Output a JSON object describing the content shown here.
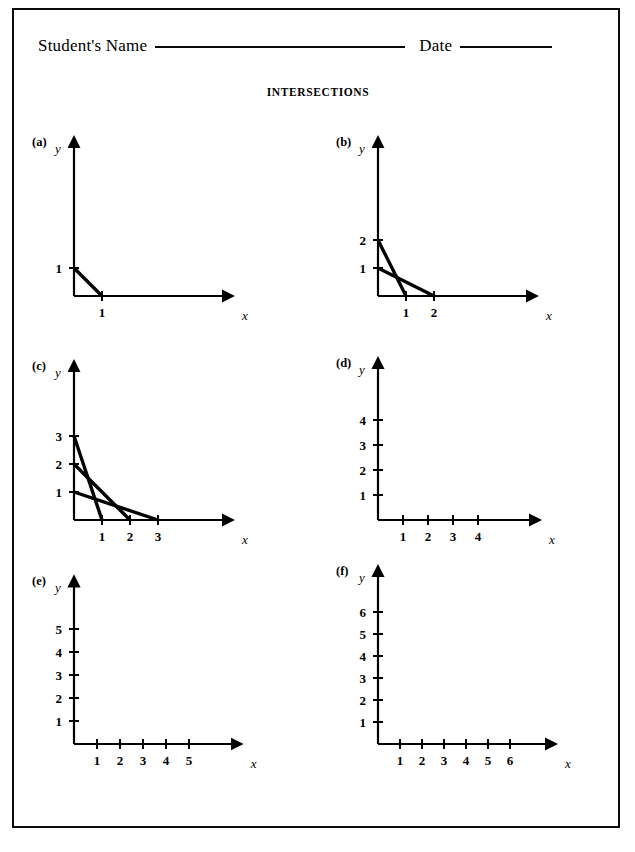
{
  "page": {
    "background": "#ffffff",
    "ink": "#000000",
    "border_color": "#0a0a0a"
  },
  "header": {
    "name_label": "Student's Name",
    "date_label": "Date",
    "name_rule": "____________________",
    "date_rule": "________"
  },
  "title": "INTERSECTIONS",
  "axis_labels": {
    "x": "x",
    "y": "y"
  },
  "panels": [
    {
      "tag": "(a)",
      "x_ticks": [
        1
      ],
      "y_ticks": [
        1
      ],
      "x_max": 5.6,
      "y_max": 5.6,
      "unit": 28,
      "segments": [
        {
          "x_intercept": 1,
          "y_intercept": 1
        }
      ]
    },
    {
      "tag": "(b)",
      "x_ticks": [
        1,
        2
      ],
      "y_ticks": [
        1,
        2
      ],
      "x_max": 5.6,
      "y_max": 5.6,
      "unit": 28,
      "segments": [
        {
          "x_intercept": 1,
          "y_intercept": 2
        },
        {
          "x_intercept": 2,
          "y_intercept": 1
        }
      ]
    },
    {
      "tag": "(c)",
      "x_ticks": [
        1,
        2,
        3
      ],
      "y_ticks": [
        1,
        2,
        3
      ],
      "x_max": 5.6,
      "y_max": 5.6,
      "unit": 28,
      "segments": [
        {
          "x_intercept": 1,
          "y_intercept": 3
        },
        {
          "x_intercept": 2,
          "y_intercept": 2
        },
        {
          "x_intercept": 3,
          "y_intercept": 1
        }
      ]
    },
    {
      "tag": "(d)",
      "x_ticks": [
        1,
        2,
        3,
        4
      ],
      "y_ticks": [
        1,
        2,
        3,
        4
      ],
      "x_max": 6.4,
      "y_max": 6.4,
      "unit": 25,
      "segments": []
    },
    {
      "tag": "(e)",
      "x_ticks": [
        1,
        2,
        3,
        4,
        5
      ],
      "y_ticks": [
        1,
        2,
        3,
        4,
        5
      ],
      "x_max": 7.2,
      "y_max": 7.2,
      "unit": 23,
      "segments": []
    },
    {
      "tag": "(f)",
      "x_ticks": [
        1,
        2,
        3,
        4,
        5,
        6
      ],
      "y_ticks": [
        1,
        2,
        3,
        4,
        5,
        6
      ],
      "x_max": 8.0,
      "y_max": 8.0,
      "unit": 22,
      "segments": []
    }
  ],
  "chart_data": {
    "type": "line",
    "title": "INTERSECTIONS",
    "xlabel": "x",
    "ylabel": "y",
    "charts": [
      {
        "label": "(a)",
        "xlim": [
          0,
          5.6
        ],
        "ylim": [
          0,
          5.6
        ],
        "xticks": [
          1
        ],
        "yticks": [
          1
        ],
        "grid": false,
        "series": [
          {
            "name": "segment-1",
            "x": [
              0,
              1
            ],
            "y": [
              1,
              0
            ]
          }
        ]
      },
      {
        "label": "(b)",
        "xlim": [
          0,
          5.6
        ],
        "ylim": [
          0,
          5.6
        ],
        "xticks": [
          1,
          2
        ],
        "yticks": [
          1,
          2
        ],
        "grid": false,
        "series": [
          {
            "name": "segment-1",
            "x": [
              0,
              1
            ],
            "y": [
              2,
              0
            ]
          },
          {
            "name": "segment-2",
            "x": [
              0,
              2
            ],
            "y": [
              1,
              0
            ]
          }
        ],
        "intersections": [
          {
            "x": 0.667,
            "y": 0.667
          }
        ]
      },
      {
        "label": "(c)",
        "xlim": [
          0,
          5.6
        ],
        "ylim": [
          0,
          5.6
        ],
        "xticks": [
          1,
          2,
          3
        ],
        "yticks": [
          1,
          2,
          3
        ],
        "grid": false,
        "series": [
          {
            "name": "segment-1",
            "x": [
              0,
              1
            ],
            "y": [
              3,
              0
            ]
          },
          {
            "name": "segment-2",
            "x": [
              0,
              2
            ],
            "y": [
              2,
              0
            ]
          },
          {
            "name": "segment-3",
            "x": [
              0,
              3
            ],
            "y": [
              1,
              0
            ]
          }
        ],
        "intersections": [
          {
            "x": 0.667,
            "y": 1.0
          },
          {
            "x": 0.75,
            "y": 0.75
          },
          {
            "x": 1.2,
            "y": 0.6
          }
        ]
      },
      {
        "label": "(d)",
        "xlim": [
          0,
          6.4
        ],
        "ylim": [
          0,
          6.4
        ],
        "xticks": [
          1,
          2,
          3,
          4
        ],
        "yticks": [
          1,
          2,
          3,
          4
        ],
        "grid": false,
        "series": []
      },
      {
        "label": "(e)",
        "xlim": [
          0,
          7.2
        ],
        "ylim": [
          0,
          7.2
        ],
        "xticks": [
          1,
          2,
          3,
          4,
          5
        ],
        "yticks": [
          1,
          2,
          3,
          4,
          5
        ],
        "grid": false,
        "series": []
      },
      {
        "label": "(f)",
        "xlim": [
          0,
          8.0
        ],
        "ylim": [
          0,
          8.0
        ],
        "xticks": [
          1,
          2,
          3,
          4,
          5,
          6
        ],
        "yticks": [
          1,
          2,
          3,
          4,
          5,
          6
        ],
        "grid": false,
        "series": []
      }
    ]
  }
}
